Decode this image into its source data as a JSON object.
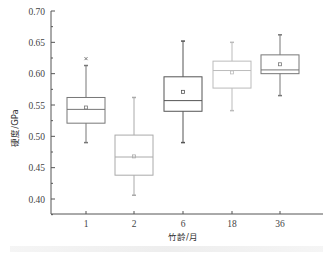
{
  "chart_data": {
    "type": "box",
    "title": "",
    "xlabel": "竹龄/月",
    "ylabel": "硬度/GPa",
    "ylim": [
      0.375,
      0.7
    ],
    "yticks": [
      "0.40",
      "0.45",
      "0.50",
      "0.55",
      "0.60",
      "0.65",
      "0.70"
    ],
    "categories": [
      "1",
      "2",
      "6",
      "18",
      "36"
    ],
    "grid": false,
    "legend": null,
    "series": [
      {
        "name": "1",
        "whisker_low": 0.49,
        "q1": 0.521,
        "median": 0.543,
        "mean": 0.546,
        "q3": 0.562,
        "whisker_high": 0.613,
        "outliers": [
          0.624
        ],
        "color": "#777777"
      },
      {
        "name": "2",
        "whisker_low": 0.406,
        "q1": 0.438,
        "median": 0.467,
        "mean": 0.468,
        "q3": 0.502,
        "whisker_high": 0.562,
        "outliers": [],
        "color": "#aaaaaa"
      },
      {
        "name": "6",
        "whisker_low": 0.49,
        "q1": 0.54,
        "median": 0.557,
        "mean": 0.571,
        "q3": 0.595,
        "whisker_high": 0.652,
        "outliers": [],
        "color": "#555555"
      },
      {
        "name": "18",
        "whisker_low": 0.541,
        "q1": 0.577,
        "median": 0.605,
        "mean": 0.602,
        "q3": 0.62,
        "whisker_high": 0.65,
        "outliers": [],
        "color": "#bbbbbb"
      },
      {
        "name": "36",
        "whisker_low": 0.565,
        "q1": 0.6,
        "median": 0.606,
        "mean": 0.615,
        "q3": 0.63,
        "whisker_high": 0.662,
        "outliers": [],
        "color": "#777777"
      }
    ]
  }
}
